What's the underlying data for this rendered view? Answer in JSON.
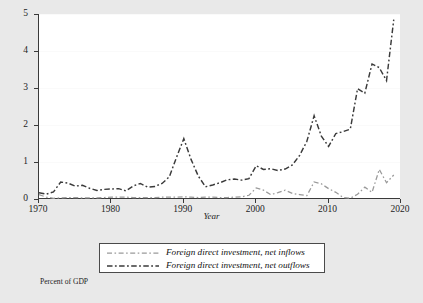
{
  "chart_data": {
    "type": "line",
    "title": "",
    "xlabel": "Year",
    "ylabel": "",
    "footnote": "Percent of GDP",
    "xlim": [
      1970,
      2020
    ],
    "ylim": [
      0,
      5
    ],
    "xticks": [
      1970,
      1980,
      1990,
      2000,
      2010,
      2020
    ],
    "yticks": [
      0,
      1,
      2,
      3,
      4,
      5
    ],
    "grid": true,
    "legend_position": "below-center",
    "x": [
      1970,
      1971,
      1972,
      1973,
      1974,
      1975,
      1976,
      1977,
      1978,
      1979,
      1980,
      1981,
      1982,
      1983,
      1984,
      1985,
      1986,
      1987,
      1988,
      1989,
      1990,
      1991,
      1992,
      1993,
      1994,
      1995,
      1996,
      1997,
      1998,
      1999,
      2000,
      2001,
      2002,
      2003,
      2004,
      2005,
      2006,
      2007,
      2008,
      2009,
      2010,
      2011,
      2012,
      2013,
      2014,
      2015,
      2016,
      2017,
      2018,
      2019
    ],
    "series": [
      {
        "name": "Foreign direct investment, net inflows",
        "color": "#9a9a9a",
        "values": [
          0.12,
          0.05,
          0.02,
          0.03,
          0.04,
          0.04,
          0.03,
          0.03,
          0.03,
          0.04,
          0.05,
          0.05,
          0.05,
          0.04,
          0.04,
          0.04,
          0.04,
          0.05,
          0.05,
          0.05,
          0.06,
          0.05,
          0.04,
          0.05,
          0.05,
          0.04,
          0.04,
          0.05,
          0.06,
          0.1,
          0.3,
          0.24,
          0.12,
          0.17,
          0.24,
          0.15,
          0.12,
          0.09,
          0.46,
          0.41,
          0.28,
          0.18,
          0.04,
          0.02,
          0.13,
          0.32,
          0.18,
          0.8,
          0.44,
          0.65
        ]
      },
      {
        "name": "Foreign direct investment, net outflows",
        "color": "#3a3a3a",
        "values": [
          0.17,
          0.13,
          0.19,
          0.46,
          0.43,
          0.35,
          0.37,
          0.29,
          0.23,
          0.26,
          0.27,
          0.28,
          0.22,
          0.35,
          0.42,
          0.32,
          0.34,
          0.42,
          0.6,
          1.13,
          1.63,
          1.07,
          0.62,
          0.33,
          0.38,
          0.44,
          0.52,
          0.54,
          0.51,
          0.55,
          0.9,
          0.8,
          0.82,
          0.77,
          0.81,
          0.92,
          1.18,
          1.56,
          2.25,
          1.7,
          1.42,
          1.77,
          1.82,
          1.89,
          2.98,
          2.86,
          3.65,
          3.55,
          3.2,
          4.85
        ]
      }
    ]
  },
  "legend": {
    "items": [
      {
        "label": "Foreign direct investment, net inflows"
      },
      {
        "label": "Foreign direct investment, net outflows"
      }
    ]
  }
}
